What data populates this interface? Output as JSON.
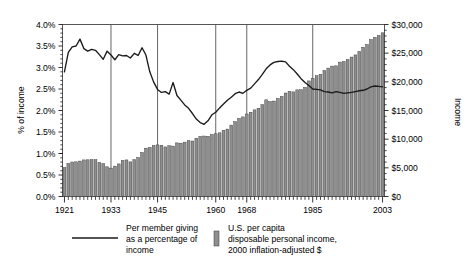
{
  "chart_data": {
    "type": "bar",
    "title": "",
    "subtitle": "",
    "xlabel": "",
    "ylabel": "% of income",
    "y2label": "Income",
    "grid": true,
    "legend_position": "bottom",
    "xlim": [
      1921,
      2003
    ],
    "ylim": [
      0,
      4.0
    ],
    "y2lim": [
      0,
      30000
    ],
    "y_tick_labels": [
      "0.0%",
      "0.5%",
      "1.0%",
      "1.5%",
      "2.0%",
      "2.5%",
      "3.0%",
      "3.5%",
      "4.0%"
    ],
    "y_tick_values": [
      0,
      0.5,
      1.0,
      1.5,
      2.0,
      2.5,
      3.0,
      3.5,
      4.0
    ],
    "y2_tick_labels": [
      "$0",
      "$5,000",
      "$10,000",
      "$15,000",
      "$20,000",
      "$25,000",
      "$30,000"
    ],
    "y2_tick_values": [
      0,
      5000,
      10000,
      15000,
      20000,
      25000,
      30000
    ],
    "x_tick_labels": [
      "1921",
      "1933",
      "1945",
      "1960",
      "1968",
      "1985",
      "2003"
    ],
    "x_tick_values": [
      1921,
      1933,
      1945,
      1960,
      1968,
      1985,
      2003
    ],
    "gridline_years": [
      1933,
      1945,
      1960,
      1968,
      1985
    ],
    "categories": [
      1921,
      1922,
      1923,
      1924,
      1925,
      1926,
      1927,
      1928,
      1929,
      1930,
      1931,
      1932,
      1933,
      1934,
      1935,
      1936,
      1937,
      1938,
      1939,
      1940,
      1941,
      1942,
      1943,
      1944,
      1945,
      1946,
      1947,
      1948,
      1949,
      1950,
      1951,
      1952,
      1953,
      1954,
      1955,
      1956,
      1957,
      1958,
      1959,
      1960,
      1961,
      1962,
      1963,
      1964,
      1965,
      1966,
      1967,
      1968,
      1969,
      1970,
      1971,
      1972,
      1973,
      1974,
      1975,
      1976,
      1977,
      1978,
      1979,
      1980,
      1981,
      1982,
      1983,
      1984,
      1985,
      1986,
      1987,
      1988,
      1989,
      1990,
      1991,
      1992,
      1993,
      1994,
      1995,
      1996,
      1997,
      1998,
      1999,
      2000,
      2001,
      2002,
      2003
    ],
    "series": [
      {
        "name": "U.S. per capita disposable personal income, 2000 inflation-adjusted $",
        "axis": "right",
        "render": "bar",
        "unit": "dollars",
        "values": [
          5050,
          5780,
          6020,
          6050,
          6180,
          6380,
          6400,
          6430,
          6420,
          5950,
          5740,
          5180,
          4950,
          5290,
          5680,
          6280,
          6380,
          6040,
          6430,
          6790,
          7670,
          8430,
          8570,
          8910,
          9000,
          8940,
          8650,
          8870,
          8790,
          9350,
          9310,
          9480,
          9740,
          9670,
          10160,
          10480,
          10550,
          10500,
          10810,
          10940,
          11110,
          11540,
          11760,
          12450,
          13050,
          13610,
          13880,
          14390,
          14700,
          15110,
          15400,
          16020,
          16870,
          16570,
          16650,
          17090,
          17450,
          18050,
          18350,
          18250,
          18600,
          18620,
          19030,
          20160,
          20620,
          21060,
          21300,
          21980,
          22400,
          22740,
          22790,
          23440,
          23540,
          23890,
          24320,
          24690,
          25300,
          26020,
          26500,
          27380,
          27750,
          28080,
          28550
        ],
        "color": "#8f8f8f"
      },
      {
        "name": "Per member giving as a percentage of income",
        "axis": "left",
        "render": "line",
        "unit": "percent",
        "values": [
          2.9,
          3.35,
          3.48,
          3.5,
          3.66,
          3.44,
          3.38,
          3.42,
          3.4,
          3.3,
          3.19,
          3.38,
          3.29,
          3.18,
          3.3,
          3.27,
          3.28,
          3.22,
          3.33,
          3.28,
          3.46,
          3.29,
          2.9,
          2.66,
          2.49,
          2.42,
          2.44,
          2.38,
          2.65,
          2.35,
          2.24,
          2.13,
          2.05,
          1.93,
          1.8,
          1.72,
          1.68,
          1.76,
          1.9,
          1.96,
          2.06,
          2.15,
          2.24,
          2.31,
          2.39,
          2.43,
          2.4,
          2.47,
          2.52,
          2.62,
          2.72,
          2.84,
          2.97,
          3.06,
          3.12,
          3.14,
          3.15,
          3.13,
          3.03,
          2.95,
          2.85,
          2.74,
          2.65,
          2.58,
          2.5,
          2.49,
          2.48,
          2.44,
          2.43,
          2.41,
          2.44,
          2.42,
          2.4,
          2.41,
          2.42,
          2.44,
          2.46,
          2.47,
          2.5,
          2.55,
          2.57,
          2.56,
          2.55
        ],
        "color": "#1a1a1a"
      }
    ],
    "legend": [
      {
        "marker": "line",
        "label_lines": [
          "Per member giving",
          "as a percentage of",
          "income"
        ]
      },
      {
        "marker": "swatch",
        "label_lines": [
          "U.S. per capita",
          "disposable personal income,",
          "2000 inflation-adjusted $"
        ]
      }
    ]
  },
  "axes": {
    "left_title": "% of income",
    "right_title": "Income"
  },
  "legend": {
    "line_label_1": "Per member giving",
    "line_label_2": "as a percentage of",
    "line_label_3": "income",
    "bar_label_1": "U.S. per capita",
    "bar_label_2": "disposable personal income,",
    "bar_label_3": "2000 inflation-adjusted $"
  },
  "colors": {
    "bar_fill": "#8f8f8f",
    "bar_stroke": "#3a3a3a",
    "line": "#1a1a1a",
    "frame": "#555555",
    "background": "#ffffff"
  }
}
